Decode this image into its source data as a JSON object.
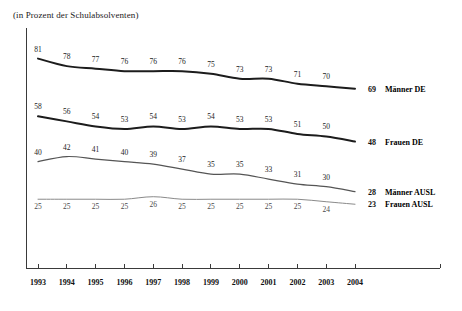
{
  "subtitle": "(in Prozent der Schulabsolventen)",
  "chart_data": {
    "type": "line",
    "title": "",
    "subtitle": "(in Prozent der Schulabsolventen)",
    "xlabel": "",
    "ylabel": "",
    "grid": false,
    "legend_position": "right-inline",
    "xlim": [
      1993,
      2004
    ],
    "ylim": [
      0,
      90
    ],
    "categories": [
      "1993",
      "1994",
      "1995",
      "1996",
      "1997",
      "1998",
      "1999",
      "2000",
      "2001",
      "2002",
      "2003",
      "2004"
    ],
    "series": [
      {
        "name": "Männer DE",
        "color": "#1c1c1c",
        "width": 2.0,
        "label_position": "above",
        "end_value": "69",
        "values": [
          81,
          78,
          77,
          76,
          76,
          76,
          75,
          73,
          73,
          71,
          70,
          69
        ],
        "labels": [
          "81",
          "78",
          "77",
          "76",
          "76",
          "76",
          "75",
          "73",
          "73",
          "71",
          "70",
          "69"
        ]
      },
      {
        "name": "Frauen DE",
        "color": "#1c1c1c",
        "width": 2.0,
        "label_position": "above",
        "end_value": "48",
        "values": [
          58,
          56,
          54,
          53,
          54,
          53,
          54,
          53,
          53,
          51,
          50,
          48
        ],
        "labels": [
          "58",
          "56",
          "54",
          "53",
          "54",
          "53",
          "54",
          "53",
          "53",
          "51",
          "50",
          "48"
        ]
      },
      {
        "name": "Männer AUSL",
        "color": "#555555",
        "width": 1.2,
        "label_position": "above",
        "end_value": "28",
        "values": [
          40,
          42,
          41,
          40,
          39,
          37,
          35,
          35,
          33,
          31,
          30,
          28
        ],
        "labels": [
          "40",
          "42",
          "41",
          "40",
          "39",
          "37",
          "35",
          "35",
          "33",
          "31",
          "30",
          "28"
        ]
      },
      {
        "name": "Frauen AUSL",
        "color": "#8a8a8a",
        "width": 1.0,
        "label_position": "below",
        "end_value": "23",
        "values": [
          25,
          25,
          25,
          25,
          26,
          25,
          25,
          25,
          25,
          25,
          24,
          23
        ],
        "labels": [
          "25",
          "25",
          "25",
          "25",
          "26",
          "25",
          "25",
          "25",
          "25",
          "25",
          "24",
          "23"
        ]
      }
    ]
  }
}
